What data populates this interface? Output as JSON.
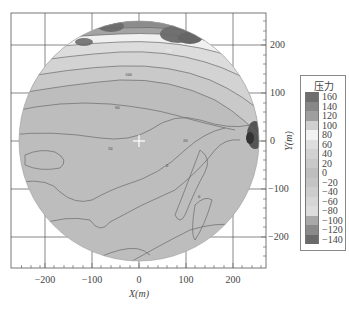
{
  "chart_data": {
    "type": "heatmap",
    "subtype": "filled-contour-circular",
    "title": "",
    "xlabel": "X(m)",
    "ylabel": "Y(m)",
    "xlim": [
      -270,
      270
    ],
    "ylim": [
      -270,
      270
    ],
    "x_ticks": [
      -200,
      -100,
      0,
      100,
      200
    ],
    "y_ticks": [
      200,
      100,
      0,
      -100,
      -200
    ],
    "grid": true,
    "domain_shape": "circle, radius ≈ 250 m centered at (0,0)",
    "center_marker": {
      "x": 0,
      "y": 0,
      "symbol": "cross"
    },
    "legend": {
      "title": "压力",
      "position": "right",
      "levels": [
        160,
        140,
        120,
        100,
        80,
        60,
        40,
        20,
        0,
        -20,
        -40,
        -60,
        -80,
        -100,
        -120,
        -140
      ]
    },
    "contour_labels": [
      {
        "text": "160",
        "x": 40,
        "y": 225
      },
      {
        "text": "100",
        "x": -30,
        "y": 155
      },
      {
        "text": "60",
        "x": -30,
        "y": 88
      },
      {
        "text": "20",
        "x": -60,
        "y": -5
      },
      {
        "text": "20",
        "x": 20,
        "y": 0
      },
      {
        "text": "0",
        "x": 20,
        "y": -45
      },
      {
        "text": "0",
        "x": 60,
        "y": -120
      }
    ],
    "regions": [
      {
        "desc": "high pressure band along north rim",
        "value_range": [
          120,
          160
        ],
        "y_range": [
          170,
          250
        ]
      },
      {
        "desc": "decreasing pressure bands from north to center",
        "value_range": [
          40,
          120
        ],
        "y_range": [
          40,
          170
        ]
      },
      {
        "desc": "broad low-gradient area south half",
        "value_range": [
          0,
          40
        ],
        "y_range": [
          -250,
          40
        ]
      },
      {
        "desc": "localized high/low pair near east rim",
        "x": 240,
        "y": 10,
        "value_range": [
          -140,
          160
        ]
      }
    ]
  },
  "legend": {
    "title": "压力",
    "items": [
      {
        "label": "160",
        "color": "#6e6e6e"
      },
      {
        "label": "140",
        "color": "#878787"
      },
      {
        "label": "120",
        "color": "#9e9e9e"
      },
      {
        "label": "100",
        "color": "#cfcfcf"
      },
      {
        "label": "80",
        "color": "#f2f2f2"
      },
      {
        "label": "60",
        "color": "#dedede"
      },
      {
        "label": "40",
        "color": "#d2d2d2"
      },
      {
        "label": "20",
        "color": "#c8c8c8"
      },
      {
        "label": "0",
        "color": "#bdbdbd"
      },
      {
        "label": "−20",
        "color": "#c4c4c4"
      },
      {
        "label": "−40",
        "color": "#cdcdcd"
      },
      {
        "label": "−60",
        "color": "#d6d6d6"
      },
      {
        "label": "−80",
        "color": "#dcdcdc"
      },
      {
        "label": "−100",
        "color": "#a8a8a8"
      },
      {
        "label": "−120",
        "color": "#8a8a8a"
      },
      {
        "label": "−140",
        "color": "#6a6a6a"
      }
    ]
  },
  "axes": {
    "x_title": "X(m)",
    "y_title": "Y(m)",
    "x_ticks": [
      "−200",
      "−100",
      "0",
      "100",
      "200"
    ],
    "y_ticks": [
      "200",
      "100",
      "0",
      "−100",
      "−200"
    ]
  },
  "contour_labels": [
    "160",
    "100",
    "60",
    "20",
    "20",
    "0",
    "0"
  ]
}
